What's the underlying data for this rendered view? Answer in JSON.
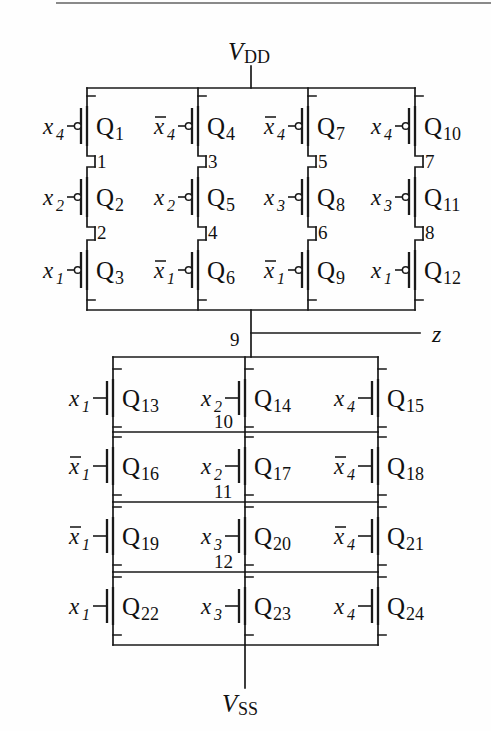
{
  "figure": {
    "kind": "cmos-transistor-schematic",
    "title_visible": false,
    "power_rails": {
      "vdd": "V",
      "vdd_sub": "DD",
      "vss": "V",
      "vss_sub": "SS"
    },
    "output": {
      "label": "z"
    },
    "colors": {
      "wire": "#1a1a1a",
      "background": "#fefefe",
      "text": "#111111"
    }
  },
  "pull_up_network": {
    "type": "pmos",
    "note": "4 parallel branches from VDD, each a series stack of 3 PMOS; bubbled gates",
    "branches": [
      {
        "column": 1,
        "transistors": [
          {
            "name": "Q",
            "index": "1",
            "gate": "x",
            "gate_sub": "4",
            "bar": false
          },
          {
            "name": "Q",
            "index": "2",
            "gate": "x",
            "gate_sub": "2",
            "bar": false
          },
          {
            "name": "Q",
            "index": "3",
            "gate": "x",
            "gate_sub": "1",
            "bar": false
          }
        ],
        "internal_nodes": [
          "1",
          "2"
        ]
      },
      {
        "column": 2,
        "transistors": [
          {
            "name": "Q",
            "index": "4",
            "gate": "x",
            "gate_sub": "4",
            "bar": true
          },
          {
            "name": "Q",
            "index": "5",
            "gate": "x",
            "gate_sub": "2",
            "bar": false
          },
          {
            "name": "Q",
            "index": "6",
            "gate": "x",
            "gate_sub": "1",
            "bar": true
          }
        ],
        "internal_nodes": [
          "3",
          "4"
        ]
      },
      {
        "column": 3,
        "transistors": [
          {
            "name": "Q",
            "index": "7",
            "gate": "x",
            "gate_sub": "4",
            "bar": true
          },
          {
            "name": "Q",
            "index": "8",
            "gate": "x",
            "gate_sub": "3",
            "bar": false
          },
          {
            "name": "Q",
            "index": "9",
            "gate": "x",
            "gate_sub": "1",
            "bar": true
          }
        ],
        "internal_nodes": [
          "5",
          "6"
        ]
      },
      {
        "column": 4,
        "transistors": [
          {
            "name": "Q",
            "index": "10",
            "gate": "x",
            "gate_sub": "4",
            "bar": false
          },
          {
            "name": "Q",
            "index": "11",
            "gate": "x",
            "gate_sub": "3",
            "bar": false
          },
          {
            "name": "Q",
            "index": "12",
            "gate": "x",
            "gate_sub": "1",
            "bar": false
          }
        ],
        "internal_nodes": [
          "7",
          "8"
        ]
      }
    ],
    "output_node": "9"
  },
  "pull_down_network": {
    "type": "nmos",
    "note": "4 series rows from node 9 to VSS, each row 3 NMOS in parallel; plain gates",
    "rows": [
      {
        "row": 1,
        "transistors": [
          {
            "name": "Q",
            "index": "13",
            "gate": "x",
            "gate_sub": "1",
            "bar": false
          },
          {
            "name": "Q",
            "index": "14",
            "gate": "x",
            "gate_sub": "2",
            "bar": false
          },
          {
            "name": "Q",
            "index": "15",
            "gate": "x",
            "gate_sub": "4",
            "bar": false
          }
        ],
        "node_below": "10"
      },
      {
        "row": 2,
        "transistors": [
          {
            "name": "Q",
            "index": "16",
            "gate": "x",
            "gate_sub": "1",
            "bar": true
          },
          {
            "name": "Q",
            "index": "17",
            "gate": "x",
            "gate_sub": "2",
            "bar": false
          },
          {
            "name": "Q",
            "index": "18",
            "gate": "x",
            "gate_sub": "4",
            "bar": true
          }
        ],
        "node_below": "11"
      },
      {
        "row": 3,
        "transistors": [
          {
            "name": "Q",
            "index": "19",
            "gate": "x",
            "gate_sub": "1",
            "bar": true
          },
          {
            "name": "Q",
            "index": "20",
            "gate": "x",
            "gate_sub": "3",
            "bar": false
          },
          {
            "name": "Q",
            "index": "21",
            "gate": "x",
            "gate_sub": "4",
            "bar": true
          }
        ],
        "node_below": "12"
      },
      {
        "row": 4,
        "transistors": [
          {
            "name": "Q",
            "index": "22",
            "gate": "x",
            "gate_sub": "1",
            "bar": false
          },
          {
            "name": "Q",
            "index": "23",
            "gate": "x",
            "gate_sub": "3",
            "bar": false
          },
          {
            "name": "Q",
            "index": "24",
            "gate": "x",
            "gate_sub": "4",
            "bar": false
          }
        ],
        "node_below": ""
      }
    ]
  }
}
